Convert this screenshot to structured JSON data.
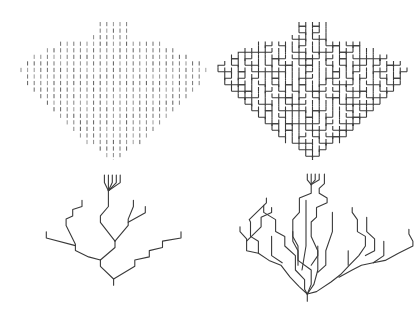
{
  "figure": {
    "ink_color": "#3a3a3a",
    "background": "#ffffff",
    "lattice": {
      "rows": [
        {
          "start": 12,
          "count": 5
        },
        {
          "start": 12,
          "count": 5
        },
        {
          "start": 11,
          "count": 6
        },
        {
          "start": 6,
          "count": 16
        },
        {
          "start": 4,
          "count": 20
        },
        {
          "start": 2,
          "count": 24
        },
        {
          "start": 1,
          "count": 27
        },
        {
          "start": 0,
          "count": 29
        },
        {
          "start": 1,
          "count": 27
        },
        {
          "start": 1,
          "count": 27
        },
        {
          "start": 2,
          "count": 25
        },
        {
          "start": 3,
          "count": 23
        },
        {
          "start": 4,
          "count": 21
        },
        {
          "start": 5,
          "count": 19
        },
        {
          "start": 6,
          "count": 17
        },
        {
          "start": 7,
          "count": 15
        },
        {
          "start": 8,
          "count": 13
        },
        {
          "start": 9,
          "count": 11
        },
        {
          "start": 10,
          "count": 9
        },
        {
          "start": 12,
          "count": 5
        },
        {
          "start": 13,
          "count": 3
        },
        {
          "start": 14,
          "count": 1
        }
      ]
    },
    "panels": [
      {
        "id": "a",
        "name": "lattice-bonds",
        "kind": "bonds"
      },
      {
        "id": "b",
        "name": "full-network",
        "kind": "network"
      },
      {
        "id": "c",
        "name": "sparse-tree",
        "kind": "tree"
      },
      {
        "id": "d",
        "name": "dense-tree",
        "kind": "tree"
      }
    ],
    "sparse_tree": [
      [
        [
          14,
          0
        ],
        [
          14,
          1.2
        ],
        [
          14.6,
          2.5
        ]
      ],
      [
        [
          14.6,
          0
        ],
        [
          14.6,
          1.2
        ],
        [
          14.6,
          2.5
        ]
      ],
      [
        [
          15.2,
          0
        ],
        [
          15.2,
          1.2
        ],
        [
          14.6,
          2.5
        ]
      ],
      [
        [
          15.8,
          0
        ],
        [
          15.8,
          1.2
        ],
        [
          14.6,
          2.5
        ]
      ],
      [
        [
          16.4,
          0
        ],
        [
          16.4,
          1.2
        ],
        [
          14.6,
          2.5
        ]
      ],
      [
        [
          14.6,
          2.5
        ],
        [
          14.6,
          5
        ],
        [
          13.4,
          6.5
        ],
        [
          13.4,
          7.5
        ],
        [
          15.6,
          10.5
        ]
      ],
      [
        [
          18.4,
          4
        ],
        [
          18.4,
          5
        ],
        [
          17.6,
          7
        ],
        [
          17.6,
          8
        ],
        [
          15.6,
          10.5
        ]
      ],
      [
        [
          20.2,
          5
        ],
        [
          20.2,
          6
        ],
        [
          17.6,
          7.5
        ]
      ],
      [
        [
          15.6,
          10.5
        ],
        [
          15.6,
          11.5
        ],
        [
          13.4,
          13.5
        ]
      ],
      [
        [
          10.6,
          4
        ],
        [
          10.6,
          5
        ],
        [
          9.2,
          5.5
        ],
        [
          9.2,
          6.5
        ],
        [
          8.2,
          7
        ],
        [
          8.2,
          8
        ],
        [
          9.6,
          11
        ],
        [
          9.6,
          12
        ],
        [
          11.6,
          13
        ],
        [
          13.4,
          13.5
        ]
      ],
      [
        [
          5.2,
          9
        ],
        [
          5.2,
          10
        ],
        [
          9.6,
          11.2
        ]
      ],
      [
        [
          13.4,
          13.5
        ],
        [
          13.4,
          14.5
        ],
        [
          15.4,
          16.5
        ],
        [
          15.4,
          17.5
        ]
      ],
      [
        [
          25.6,
          9
        ],
        [
          25.6,
          10
        ],
        [
          22.8,
          10.5
        ],
        [
          22.8,
          11.5
        ],
        [
          20.8,
          12
        ],
        [
          20.8,
          13
        ],
        [
          18.6,
          13.5
        ],
        [
          18.6,
          14.5
        ],
        [
          15.4,
          16.5
        ]
      ]
    ],
    "dense_tree": [
      [
        [
          10.8,
          0
        ],
        [
          10.8,
          1.2
        ],
        [
          11.4,
          2.2
        ]
      ],
      [
        [
          11.4,
          0
        ],
        [
          11.4,
          1.2
        ],
        [
          11.4,
          2.2
        ]
      ],
      [
        [
          12,
          0
        ],
        [
          12,
          1.2
        ],
        [
          11.4,
          2.2
        ]
      ],
      [
        [
          12.6,
          0
        ],
        [
          12.6,
          1.2
        ],
        [
          11.4,
          2.2
        ]
      ],
      [
        [
          11.4,
          2.2
        ],
        [
          11.4,
          4
        ],
        [
          9.6,
          5
        ],
        [
          9.6,
          8
        ],
        [
          8.6,
          9.5
        ],
        [
          8.6,
          13
        ],
        [
          9.4,
          15
        ],
        [
          9.4,
          18
        ],
        [
          11.4,
          20
        ],
        [
          11.4,
          23
        ],
        [
          10.8,
          25
        ]
      ],
      [
        [
          13.4,
          0
        ],
        [
          13.4,
          2
        ],
        [
          12.6,
          3
        ],
        [
          12.6,
          4
        ],
        [
          13.8,
          5
        ],
        [
          13.8,
          6
        ],
        [
          12.2,
          7
        ],
        [
          12.2,
          9
        ],
        [
          11.4,
          10
        ],
        [
          11.4,
          13
        ],
        [
          12.4,
          16
        ],
        [
          12.4,
          20
        ],
        [
          11.8,
          23
        ],
        [
          10.8,
          25
        ]
      ],
      [
        [
          4.2,
          6.5
        ],
        [
          4.2,
          8
        ],
        [
          6,
          9.5
        ],
        [
          6,
          12
        ],
        [
          7.4,
          13
        ],
        [
          7.4,
          15
        ],
        [
          9,
          17
        ],
        [
          9,
          20
        ],
        [
          10.4,
          22
        ],
        [
          10.4,
          24
        ],
        [
          10.8,
          25
        ]
      ],
      [
        [
          10.6,
          5.5
        ],
        [
          10.6,
          15
        ],
        [
          10,
          20
        ]
      ],
      [
        [
          14.6,
          8
        ],
        [
          14.6,
          12
        ],
        [
          13.6,
          16
        ],
        [
          13.6,
          19
        ],
        [
          12.4,
          20.5
        ]
      ],
      [
        [
          8.6,
          12
        ],
        [
          8.6,
          14
        ],
        [
          9.4,
          16
        ],
        [
          9.4,
          19
        ]
      ],
      [
        [
          12.4,
          15
        ],
        [
          12.4,
          17
        ],
        [
          11.4,
          19
        ]
      ],
      [
        [
          17.6,
          7
        ],
        [
          17.6,
          8
        ],
        [
          18.4,
          9.5
        ],
        [
          18.4,
          12
        ],
        [
          19.6,
          13
        ],
        [
          19.6,
          15
        ],
        [
          18.6,
          17
        ],
        [
          17.2,
          19
        ],
        [
          15.8,
          21
        ],
        [
          14.4,
          22.5
        ],
        [
          12.2,
          24.5
        ],
        [
          10.8,
          25
        ]
      ],
      [
        [
          19.8,
          9
        ],
        [
          19.8,
          12
        ],
        [
          21,
          13.5
        ],
        [
          21,
          16
        ],
        [
          19.6,
          17
        ]
      ],
      [
        [
          22.4,
          14
        ],
        [
          22.4,
          17
        ],
        [
          20.8,
          18.5
        ]
      ],
      [
        [
          26.2,
          11.5
        ],
        [
          26.2,
          12.5
        ],
        [
          26.8,
          14
        ],
        [
          26.8,
          15
        ],
        [
          24.6,
          16.5
        ],
        [
          22.6,
          18
        ],
        [
          20.8,
          18.5
        ],
        [
          19,
          19
        ],
        [
          17.6,
          20
        ],
        [
          15.6,
          21.5
        ]
      ],
      [
        [
          4.6,
          5
        ],
        [
          4.6,
          6
        ],
        [
          2,
          9.5
        ],
        [
          2.2,
          10
        ],
        [
          2.2,
          13
        ],
        [
          3.4,
          14
        ],
        [
          3.4,
          16.5
        ],
        [
          5,
          18
        ],
        [
          6.8,
          19
        ],
        [
          8.2,
          21.5
        ],
        [
          9.6,
          23.5
        ],
        [
          10.8,
          25
        ]
      ],
      [
        [
          0.6,
          11
        ],
        [
          0.6,
          12
        ],
        [
          1.6,
          13.5
        ],
        [
          1.6,
          16
        ],
        [
          3.4,
          16.5
        ]
      ],
      [
        [
          1.6,
          14
        ],
        [
          3.8,
          11
        ],
        [
          3.8,
          9
        ],
        [
          5.4,
          8
        ],
        [
          5.4,
          7
        ]
      ],
      [
        [
          5.4,
          13
        ],
        [
          5.4,
          17
        ],
        [
          7,
          18.5
        ]
      ],
      [
        [
          17,
          16
        ],
        [
          17,
          19
        ]
      ],
      [
        [
          10.8,
          25
        ],
        [
          10.8,
          26.5
        ]
      ]
    ]
  }
}
